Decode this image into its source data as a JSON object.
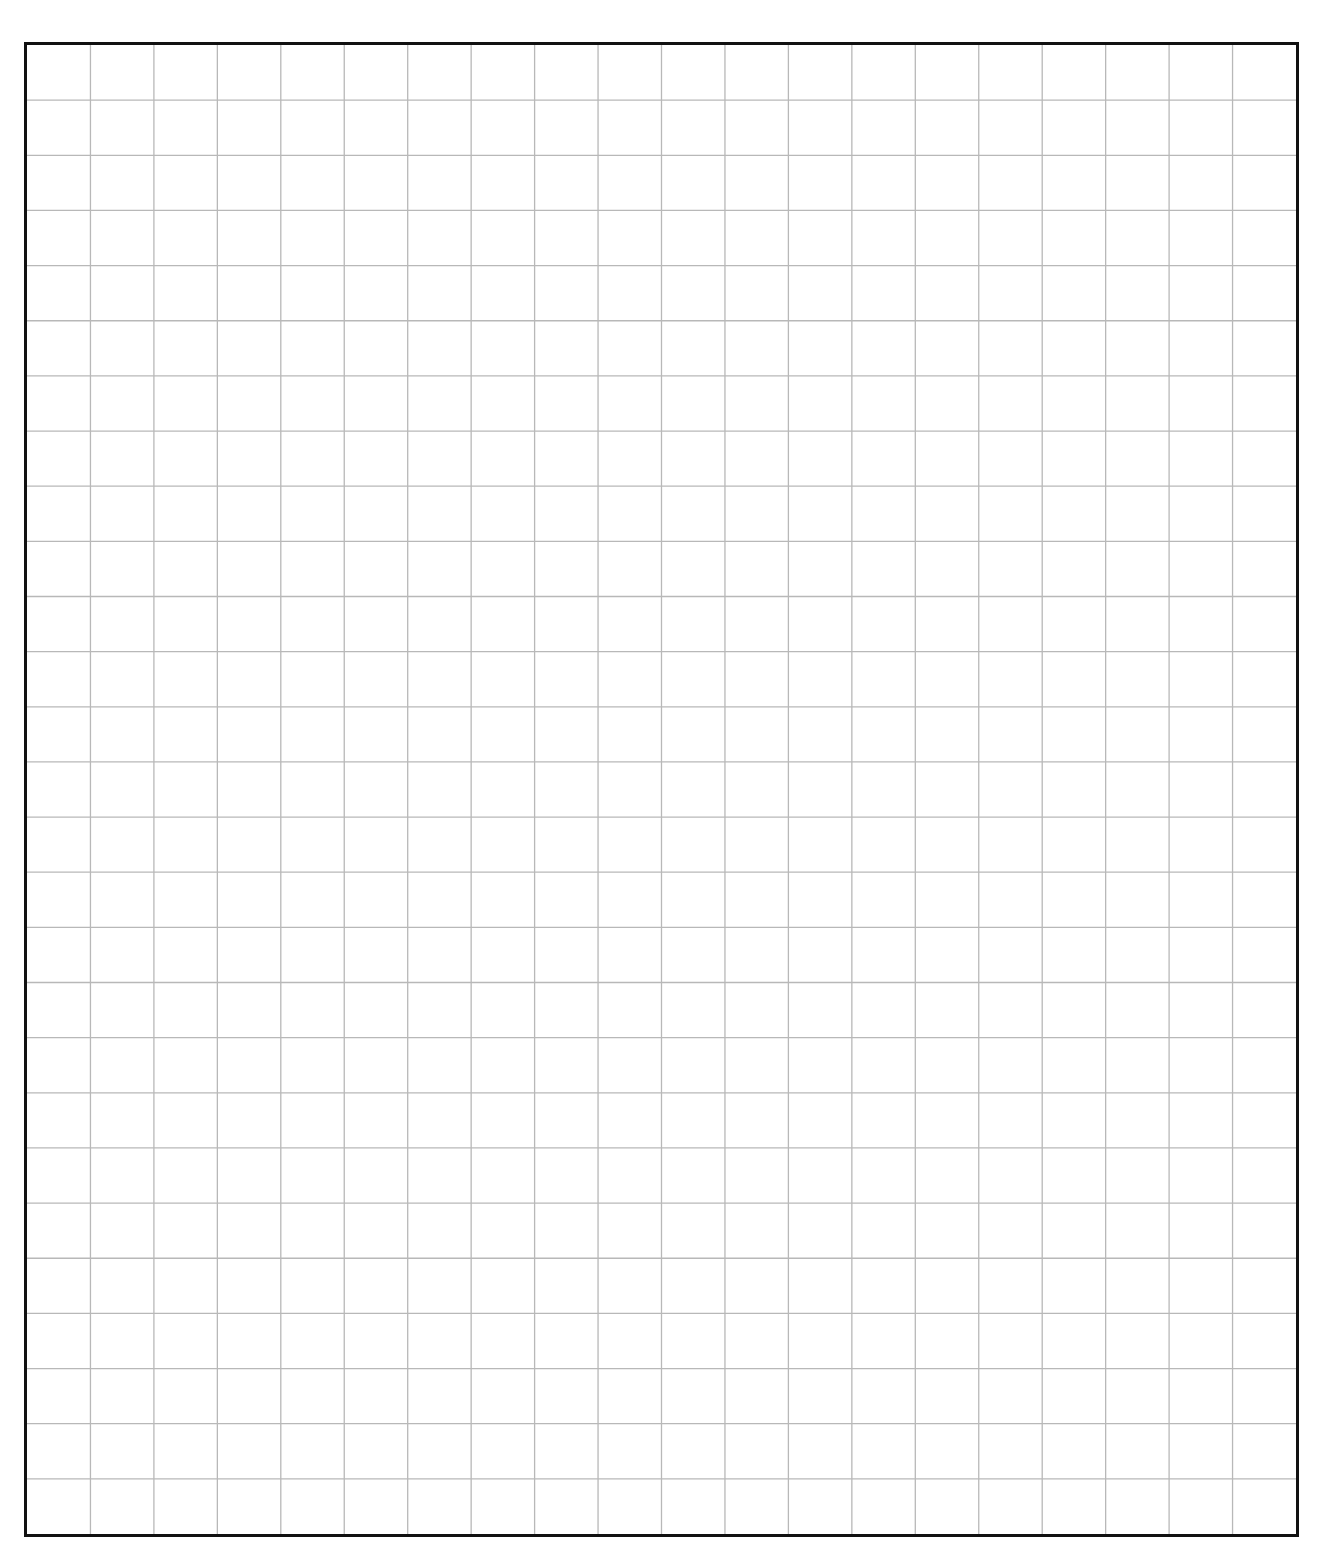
{
  "sheet": {
    "type": "grid-paper",
    "columns": 20,
    "rows": 27,
    "border_color": "#111111",
    "grid_color": "#b8b8b8",
    "background": "#ffffff"
  }
}
